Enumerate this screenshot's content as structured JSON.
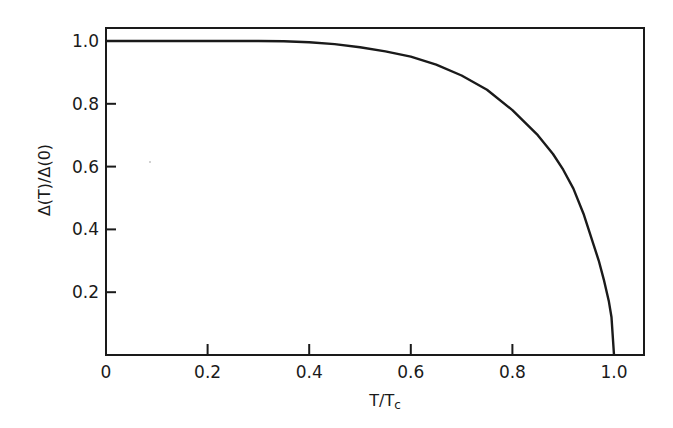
{
  "chart_data": {
    "type": "line",
    "title": "",
    "xlabel": "T/T",
    "xlabel_subscript": "c",
    "ylabel": "Δ(T)/Δ(0)",
    "xlim": [
      0,
      1.06
    ],
    "ylim": [
      0,
      1.04
    ],
    "grid": false,
    "legend": null,
    "x_ticks": [
      0,
      0.2,
      0.4,
      0.6,
      0.8,
      1.0
    ],
    "x_tick_labels": [
      "0",
      "0.2",
      "0.4",
      "0.6",
      "0.8",
      "1.0"
    ],
    "y_ticks": [
      0.2,
      0.4,
      0.6,
      0.8,
      1.0
    ],
    "y_tick_labels": [
      "0.2",
      "0.4",
      "0.6",
      "0.8",
      "1.0"
    ],
    "series": [
      {
        "name": "Δ(T)/Δ(0)",
        "x": [
          0,
          0.1,
          0.2,
          0.3,
          0.35,
          0.4,
          0.45,
          0.5,
          0.55,
          0.6,
          0.65,
          0.7,
          0.75,
          0.8,
          0.85,
          0.88,
          0.9,
          0.92,
          0.94,
          0.96,
          0.97,
          0.98,
          0.99,
          0.995,
          1.0
        ],
        "y": [
          1.0,
          1.0,
          1.0,
          1.0,
          0.999,
          0.996,
          0.99,
          0.98,
          0.967,
          0.95,
          0.925,
          0.89,
          0.845,
          0.78,
          0.7,
          0.64,
          0.59,
          0.53,
          0.45,
          0.35,
          0.3,
          0.24,
          0.17,
          0.12,
          0.0
        ]
      }
    ]
  }
}
